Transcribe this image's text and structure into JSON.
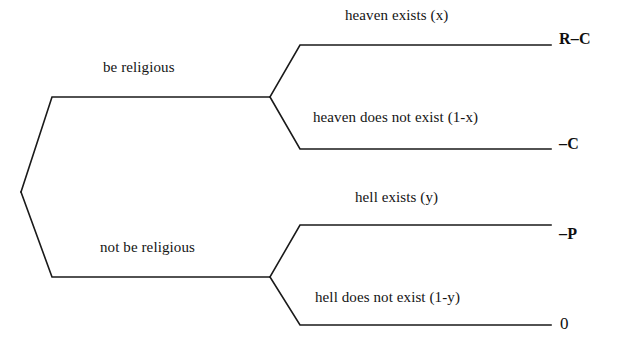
{
  "diagram": {
    "type": "decision-tree",
    "stroke_color": "#1a1a1a",
    "background_color": "#ffffff",
    "root": {
      "name": "root-decision-node",
      "x": 21,
      "y": 192
    },
    "branches": [
      {
        "id": "be-religious",
        "label": "be religious",
        "node": {
          "x": 270,
          "y": 97
        },
        "outcomes": [
          {
            "id": "heaven-exists",
            "label": "heaven exists (x)",
            "payoff": "R–C",
            "probability": "x",
            "line_y": 45
          },
          {
            "id": "heaven-does-not-exist",
            "label": "heaven does not exist (1-x)",
            "payoff": "–C",
            "probability": "1-x",
            "line_y": 149
          }
        ]
      },
      {
        "id": "not-be-religious",
        "label": "not be religious",
        "node": {
          "x": 270,
          "y": 275
        },
        "outcomes": [
          {
            "id": "hell-exists",
            "label": "hell exists (y)",
            "payoff": "–P",
            "probability": "y",
            "line_y": 225
          },
          {
            "id": "hell-does-not-exist",
            "label": "hell does not exist (1-y)",
            "payoff": "0",
            "probability": "1-y",
            "line_y": 325
          }
        ]
      }
    ]
  }
}
